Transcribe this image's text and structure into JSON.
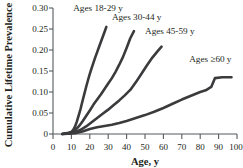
{
  "chart_data": {
    "type": "line",
    "title": "",
    "xlabel": "Age, y",
    "ylabel": "Cumulative Lifetime Prevalence",
    "xlim": [
      0,
      100
    ],
    "ylim": [
      0,
      0.3
    ],
    "xticks": [
      "0",
      "10",
      "20",
      "30",
      "40",
      "50",
      "60",
      "70",
      "80",
      "90",
      "100"
    ],
    "yticks": [
      "0",
      "0.05",
      "0.10",
      "0.15",
      "0.20",
      "0.25",
      "0.30"
    ],
    "grid": false,
    "legend_position": "inline-annotations",
    "line_color": "#3b3b3d",
    "axis_color": "#555b5e",
    "series": [
      {
        "name": "Ages 18-29 y",
        "label": "Ages 18-29 y",
        "x": [
          5,
          8,
          10,
          11,
          12,
          13,
          14,
          15,
          16,
          17,
          18,
          19,
          20,
          21,
          22,
          23,
          24,
          25,
          26,
          27,
          28,
          29
        ],
        "values": [
          0.0,
          0.002,
          0.005,
          0.01,
          0.018,
          0.03,
          0.045,
          0.06,
          0.078,
          0.095,
          0.112,
          0.128,
          0.143,
          0.157,
          0.17,
          0.183,
          0.195,
          0.207,
          0.219,
          0.231,
          0.243,
          0.255
        ]
      },
      {
        "name": "Ages 30-44 y",
        "label": "Ages 30-44 y",
        "x": [
          5,
          8,
          10,
          12,
          14,
          16,
          18,
          20,
          22,
          24,
          26,
          28,
          30,
          32,
          34,
          36,
          38,
          40,
          42,
          44
        ],
        "values": [
          0.0,
          0.002,
          0.004,
          0.009,
          0.018,
          0.03,
          0.043,
          0.056,
          0.07,
          0.082,
          0.094,
          0.107,
          0.12,
          0.133,
          0.148,
          0.165,
          0.183,
          0.205,
          0.228,
          0.245
        ]
      },
      {
        "name": "Ages 45-59 y",
        "label": "Ages 45-59 y",
        "x": [
          5,
          9,
          12,
          15,
          18,
          21,
          24,
          27,
          30,
          33,
          36,
          39,
          42,
          45,
          48,
          51,
          54,
          57,
          59
        ],
        "values": [
          0.0,
          0.002,
          0.004,
          0.01,
          0.018,
          0.028,
          0.038,
          0.048,
          0.058,
          0.069,
          0.08,
          0.092,
          0.105,
          0.123,
          0.143,
          0.163,
          0.182,
          0.198,
          0.208
        ]
      },
      {
        "name": "Ages >=60 y",
        "label": "Ages ≥60 y",
        "x": [
          6,
          12,
          16,
          20,
          24,
          28,
          32,
          36,
          40,
          45,
          50,
          55,
          60,
          65,
          70,
          75,
          80,
          83,
          86,
          88,
          92,
          97
        ],
        "values": [
          0.0,
          0.002,
          0.006,
          0.012,
          0.016,
          0.019,
          0.022,
          0.026,
          0.031,
          0.038,
          0.045,
          0.053,
          0.062,
          0.072,
          0.082,
          0.091,
          0.1,
          0.104,
          0.112,
          0.133,
          0.135,
          0.135
        ]
      }
    ],
    "annotations": [
      {
        "text": "Ages 18-29 y",
        "x": 11,
        "y": 0.292
      },
      {
        "text": "Ages 30-44 y",
        "x": 32,
        "y": 0.272
      },
      {
        "text": "Ages 45-59 y",
        "x": 50,
        "y": 0.238
      },
      {
        "text": "Ages ≥60 y",
        "x": 74,
        "y": 0.172
      }
    ]
  }
}
